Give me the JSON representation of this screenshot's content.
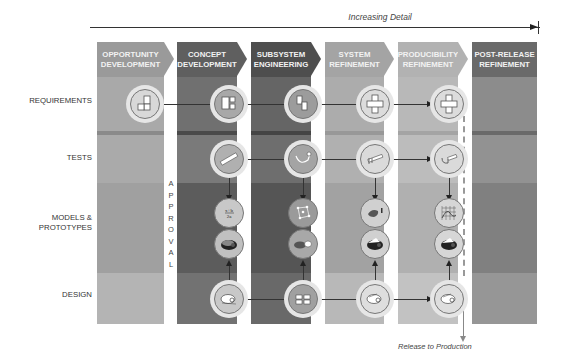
{
  "title_arrow": {
    "label": "Increasing Detail"
  },
  "rows": [
    {
      "id": "requirements",
      "label": "REQUIREMENTS"
    },
    {
      "id": "tests",
      "label": "TESTS"
    },
    {
      "id": "models",
      "label": "MODELS &\nPROTOTYPES",
      "line1": "MODELS &",
      "line2": "PROTOTYPES"
    },
    {
      "id": "design",
      "label": "DESIGN"
    }
  ],
  "phases": [
    {
      "line1": "OPPORTUNITY",
      "line2": "DEVELOPMENT",
      "color_hdr": "#9a9a9a",
      "color_req": "#a9a9a9",
      "color_tests": "#aaaaaa",
      "color_models": "#a0a0a0",
      "color_design": "#b4b4b4"
    },
    {
      "line1": "CONCEPT",
      "line2": "DEVELOPMENT",
      "color_hdr": "#5f5f5f",
      "color_req": "#707070",
      "color_tests": "#7a7a7a",
      "color_models": "#5c5c5c",
      "color_design": "#727272"
    },
    {
      "line1": "SUBSYSTEM",
      "line2": "ENGINEERING",
      "color_hdr": "#4e4e4e",
      "color_req": "#656565",
      "color_tests": "#6e6e6e",
      "color_models": "#555555",
      "color_design": "#696969"
    },
    {
      "line1": "SYSTEM",
      "line2": "REFINEMENT",
      "color_hdr": "#a4a4a4",
      "color_req": "#acacac",
      "color_tests": "#b0b0b0",
      "color_models": "#a2a2a2",
      "color_design": "#b8b8b8"
    },
    {
      "line1": "PRODUCIBILITY",
      "line2": "REFINEMENT",
      "color_hdr": "#b2b2b2",
      "color_req": "#b8b8b8",
      "color_tests": "#bcbcbc",
      "color_models": "#b0b0b0",
      "color_design": "#c2c2c2"
    },
    {
      "line1": "POST-RELEASE",
      "line2": "REFINEMENT",
      "color_hdr": "#6a6a6a",
      "color_req": "#8c8c8c",
      "color_tests": "#929292",
      "color_models": "#808080",
      "color_design": "#969696"
    }
  ],
  "gate_label": "APPROVAL",
  "gate_letters": [
    "A",
    "P",
    "P",
    "R",
    "O",
    "V",
    "A",
    "L"
  ],
  "release_label": "Release to Production",
  "nodes": {
    "requirements": [
      "sketch-blocks-icon",
      "block-diagram-icon",
      "subsystem-blocks-icon",
      "cross-layout-icon",
      "cross-layout-icon"
    ],
    "tests": [
      "ruler-icon",
      "caliper-icon",
      "vernier-caliper-icon",
      "micrometer-icon"
    ],
    "models": [
      "equation-icon",
      "mesh-model-icon",
      "prototype-part-icon",
      "graph-plot-icon"
    ],
    "prototypes": [
      "rendered-part-icon",
      "rendered-part-split-icon",
      "rendered-part-icon",
      "rendered-part-icon"
    ],
    "design": [
      "cad-sketch-icon",
      "schematic-grid-icon",
      "cad-part-icon",
      "cad-part-icon"
    ]
  }
}
